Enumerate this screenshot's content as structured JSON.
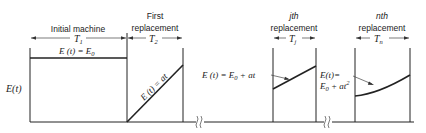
{
  "diagram": {
    "y_axis_label": "E(t)",
    "sections": [
      {
        "id": "initial",
        "header_line1": "",
        "header_line2": "Initial machine",
        "period": "T",
        "period_sub": "1",
        "equation": "E (t) = E",
        "equation_sub": "0",
        "curve": "constant"
      },
      {
        "id": "first",
        "header_line1": "First",
        "header_line2": "replacement",
        "period": "T",
        "period_sub": "2",
        "equation": "E (t) = at",
        "curve": "linear-from-zero"
      },
      {
        "id": "jth",
        "header_line1": "jth",
        "header_line2": "replacement",
        "period": "T",
        "period_sub": "j",
        "equation": "E (t) = E",
        "equation_sub": "0",
        "equation_tail": " + at",
        "curve": "linear-offset"
      },
      {
        "id": "nth",
        "header_line1": "nth",
        "header_line2": "replacement",
        "period": "T",
        "period_sub": "n",
        "equation_line1": "E(t)=",
        "equation_line2": "E",
        "equation_line2_sub": "0",
        "equation_line2_tail": " + at",
        "equation_line2_sup": "2",
        "curve": "quadratic-offset"
      }
    ],
    "break_marks": 2
  }
}
